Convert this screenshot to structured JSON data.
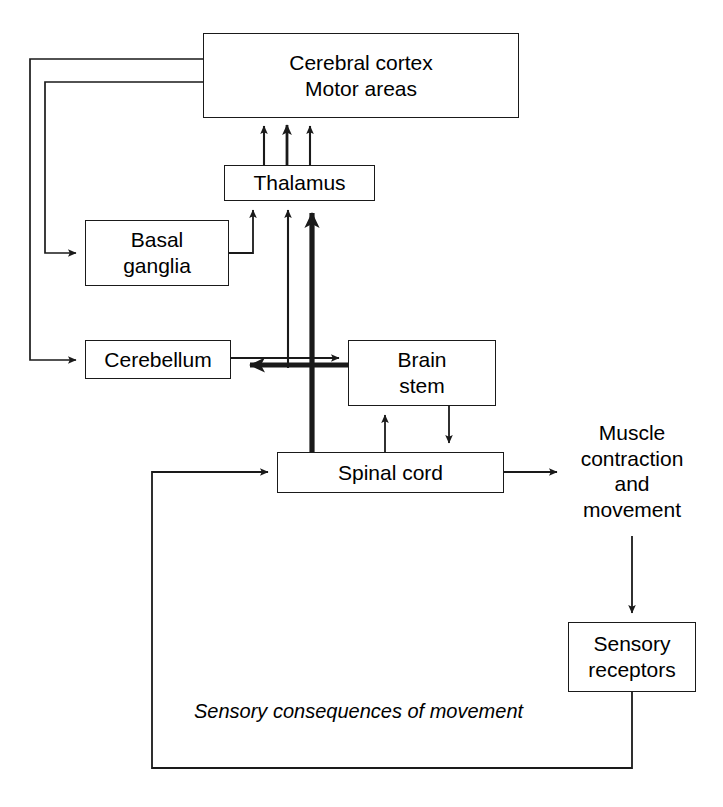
{
  "diagram": {
    "stroke_color": "#1a1a1a",
    "background_color": "#ffffff",
    "nodes": [
      {
        "id": "cerebral-cortex",
        "label": "Cerebral cortex\nMotor areas",
        "x": 203,
        "y": 33,
        "w": 316,
        "h": 85,
        "shape": "rect"
      },
      {
        "id": "thalamus",
        "label": "Thalamus",
        "x": 224,
        "y": 165,
        "w": 151,
        "h": 36,
        "shape": "rect"
      },
      {
        "id": "basal-ganglia",
        "label": "Basal\nganglia",
        "x": 85,
        "y": 220,
        "w": 144,
        "h": 66,
        "shape": "rect"
      },
      {
        "id": "cerebellum",
        "label": "Cerebellum",
        "x": 85,
        "y": 340,
        "w": 146,
        "h": 39,
        "shape": "rect"
      },
      {
        "id": "brain-stem",
        "label": "Brain\nstem",
        "x": 348,
        "y": 340,
        "w": 148,
        "h": 66,
        "shape": "rect"
      },
      {
        "id": "spinal-cord",
        "label": "Spinal cord",
        "x": 277,
        "y": 452,
        "w": 227,
        "h": 41,
        "shape": "rect"
      },
      {
        "id": "sensory-receptors",
        "label": "Sensory\nreceptors",
        "x": 568,
        "y": 622,
        "w": 128,
        "h": 70,
        "shape": "rect"
      }
    ],
    "free_labels": [
      {
        "id": "muscle-contraction-and-movement",
        "label": "Muscle\ncontraction\nand\nmovement",
        "x": 567,
        "y": 420,
        "w": 130,
        "h": 112,
        "style": "plain"
      }
    ],
    "annotations": [
      {
        "id": "sensory-consequences-of-movement",
        "label": "Sensory consequences of movement",
        "x": 190,
        "y": 700,
        "style": "italic"
      }
    ],
    "edges": [
      {
        "id": "thalamus-to-cortex-left",
        "from": "thalamus",
        "to": "cerebral-cortex",
        "weight": "thin"
      },
      {
        "id": "thalamus-to-cortex-middle",
        "from": "thalamus",
        "to": "cerebral-cortex",
        "weight": "medium"
      },
      {
        "id": "thalamus-to-cortex-right",
        "from": "thalamus",
        "to": "cerebral-cortex",
        "weight": "thin"
      },
      {
        "id": "cortex-to-basal-ganglia",
        "from": "cerebral-cortex",
        "to": "basal-ganglia",
        "weight": "thin"
      },
      {
        "id": "cortex-to-cerebellum",
        "from": "cerebral-cortex",
        "to": "cerebellum",
        "weight": "thin"
      },
      {
        "id": "basal-ganglia-to-thalamus",
        "from": "basal-ganglia",
        "to": "thalamus",
        "weight": "thin"
      },
      {
        "id": "cerebellum-path-to-thalamus",
        "from": "cerebellum",
        "to": "thalamus",
        "weight": "thin"
      },
      {
        "id": "spinal-cord-to-thalamus",
        "from": "spinal-cord",
        "to": "thalamus",
        "weight": "thick"
      },
      {
        "id": "spinal-cord-to-cerebellum",
        "from": "spinal-cord",
        "to": "cerebellum",
        "weight": "thick"
      },
      {
        "id": "cerebellum-to-brain-stem",
        "from": "cerebellum",
        "to": "brain-stem",
        "weight": "thin"
      },
      {
        "id": "spinal-cord-to-brain-stem",
        "from": "spinal-cord",
        "to": "brain-stem",
        "weight": "thin"
      },
      {
        "id": "brain-stem-to-spinal-cord",
        "from": "brain-stem",
        "to": "spinal-cord",
        "weight": "thin"
      },
      {
        "id": "spinal-cord-to-muscle",
        "from": "spinal-cord",
        "to": "muscle-contraction-and-movement",
        "weight": "thin"
      },
      {
        "id": "muscle-to-sensory-receptors",
        "from": "muscle-contraction-and-movement",
        "to": "sensory-receptors",
        "weight": "thin"
      },
      {
        "id": "sensory-receptors-to-spinal-cord",
        "from": "sensory-receptors",
        "to": "spinal-cord",
        "weight": "thin",
        "label": "Sensory consequences of movement"
      }
    ]
  }
}
